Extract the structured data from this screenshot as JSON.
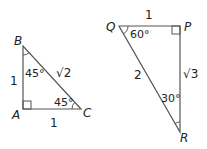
{
  "triangle_45": {
    "vertices": {
      "B": "B",
      "A": "A",
      "C": "C"
    },
    "sides": {
      "AB": "1",
      "AC": "1",
      "BC": "√2"
    },
    "angles": {
      "B": "45°",
      "C": "45°"
    },
    "right_angle_at": "A"
  },
  "triangle_30_60": {
    "vertices": {
      "Q": "Q",
      "P": "P",
      "R": "R"
    },
    "sides": {
      "QP": "1",
      "PR": "√3",
      "QR": "2"
    },
    "angles": {
      "Q": "60°",
      "R": "30°"
    },
    "right_angle_at": "P"
  },
  "colors": {
    "line": "#555555",
    "text": "#222222"
  }
}
